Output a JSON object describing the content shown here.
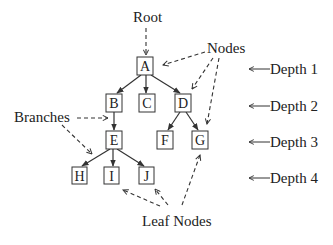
{
  "diagram": {
    "type": "tree",
    "nodes": [
      {
        "id": "A",
        "label": "A",
        "depth": 1,
        "x": 145,
        "y": 66
      },
      {
        "id": "B",
        "label": "B",
        "depth": 2,
        "x": 114,
        "y": 103
      },
      {
        "id": "C",
        "label": "C",
        "depth": 2,
        "x": 147,
        "y": 103
      },
      {
        "id": "D",
        "label": "D",
        "depth": 2,
        "x": 183,
        "y": 103
      },
      {
        "id": "E",
        "label": "E",
        "depth": 3,
        "x": 114,
        "y": 140
      },
      {
        "id": "F",
        "label": "F",
        "depth": 3,
        "x": 165,
        "y": 140
      },
      {
        "id": "G",
        "label": "G",
        "depth": 3,
        "x": 200,
        "y": 140
      },
      {
        "id": "H",
        "label": "H",
        "depth": 4,
        "x": 79,
        "y": 176
      },
      {
        "id": "I",
        "label": "I",
        "depth": 4,
        "x": 112,
        "y": 176
      },
      {
        "id": "J",
        "label": "J",
        "depth": 4,
        "x": 146,
        "y": 176
      }
    ],
    "edges": [
      [
        "A",
        "B"
      ],
      [
        "A",
        "C"
      ],
      [
        "A",
        "D"
      ],
      [
        "B",
        "E"
      ],
      [
        "D",
        "F"
      ],
      [
        "D",
        "G"
      ],
      [
        "E",
        "H"
      ],
      [
        "E",
        "I"
      ],
      [
        "E",
        "J"
      ]
    ],
    "annotations": {
      "root": "Root",
      "nodes": "Nodes",
      "branches": "Branches",
      "leaf_nodes": "Leaf Nodes"
    },
    "depth_labels": [
      "Depth 1",
      "Depth 2",
      "Depth 3",
      "Depth 4"
    ]
  }
}
